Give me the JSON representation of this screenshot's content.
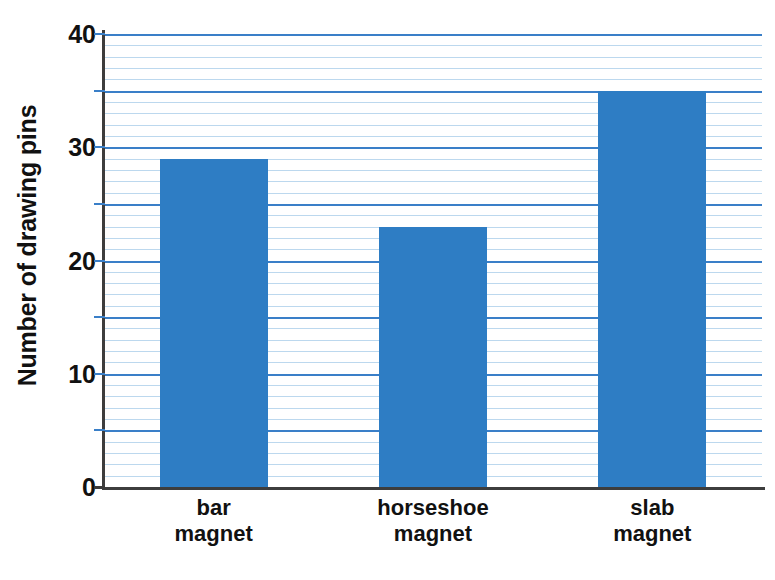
{
  "chart_data": {
    "type": "bar",
    "title": "",
    "subtitle": "",
    "xlabel": "",
    "ylabel": "Number of drawing pins",
    "categories": [
      "bar magnet",
      "horseshoe magnet",
      "slab magnet"
    ],
    "category_lines": [
      [
        "bar",
        "magnet"
      ],
      [
        "horseshoe",
        "magnet"
      ],
      [
        "slab",
        "magnet"
      ]
    ],
    "values": [
      29,
      23,
      35
    ],
    "ylim": [
      0,
      40
    ],
    "y_major_labels": [
      "0",
      "10",
      "20",
      "30",
      "40"
    ],
    "y_major_values": [
      0,
      10,
      20,
      30,
      40
    ],
    "y_tick_values": [
      0,
      5,
      10,
      15,
      20,
      25,
      30,
      35,
      40
    ],
    "y_minor_step": 1,
    "grid": true,
    "legend": "none",
    "colors": {
      "bar_fill": "#2e7dc4",
      "gridline_minor": "#bcd8ee",
      "gridline_major": "#3a7fc8",
      "axis_line": "#3d3d3d",
      "text": "#111111",
      "background": "#ffffff"
    }
  }
}
